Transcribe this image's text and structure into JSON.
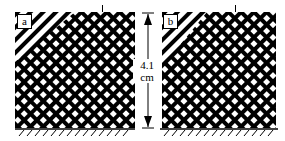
{
  "figure": {
    "panels": [
      {
        "label": "a"
      },
      {
        "label": "b"
      }
    ],
    "dimension": {
      "value": "4.1",
      "unit": "cm"
    },
    "colors": {
      "ink": "#000000",
      "paper": "#ffffff"
    }
  }
}
